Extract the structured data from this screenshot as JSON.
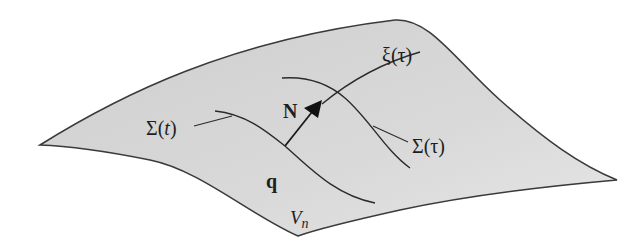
{
  "diagram": {
    "surface": {
      "label": "V",
      "label_sub": "n",
      "fill": "#d6d6d6",
      "stroke": "#3a3a3a"
    },
    "labels": {
      "sigma_t": "Σ(t)",
      "sigma_t_main": "Σ(",
      "sigma_t_var": "t",
      "sigma_t_close": ")",
      "normal": "N",
      "xi_tau": "ξ(τ)",
      "sigma_tau": "Σ(τ)",
      "point": "q"
    },
    "colors": {
      "line": "#2a2a2a",
      "text": "#1e1e1e",
      "background": "#ffffff"
    }
  }
}
